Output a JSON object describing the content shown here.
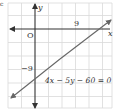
{
  "figure": {
    "corner_mark": "c",
    "axes": {
      "x_label": "x",
      "y_label": "y",
      "origin_label": "O",
      "x_tick_label": "9",
      "y_tick_label": "−9"
    },
    "line": {
      "equation": "4x − 5y − 60 = 0",
      "x_intercept": 15,
      "y_intercept": -12
    },
    "colors": {
      "grid": "#d9d9d9",
      "axis": "#333333",
      "line": "#666666",
      "text": "#333333",
      "background": "#ffffff"
    }
  }
}
